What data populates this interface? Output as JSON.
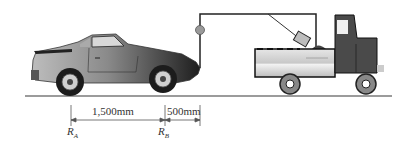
{
  "figure": {
    "dimensions": {
      "ra_to_rb": "1,500mm",
      "rb_to_hook": "500mm"
    },
    "reaction_labels": {
      "ra": {
        "main": "R",
        "sub": "A"
      },
      "rb": {
        "main": "R",
        "sub": "B"
      }
    },
    "colors": {
      "ground": "#777777",
      "car_body": "#6e6e6e",
      "truck_bed": "#d4d4d4",
      "truck_cab": "#4a4a4a",
      "cable": "#222222",
      "pulley": "#999999"
    }
  }
}
